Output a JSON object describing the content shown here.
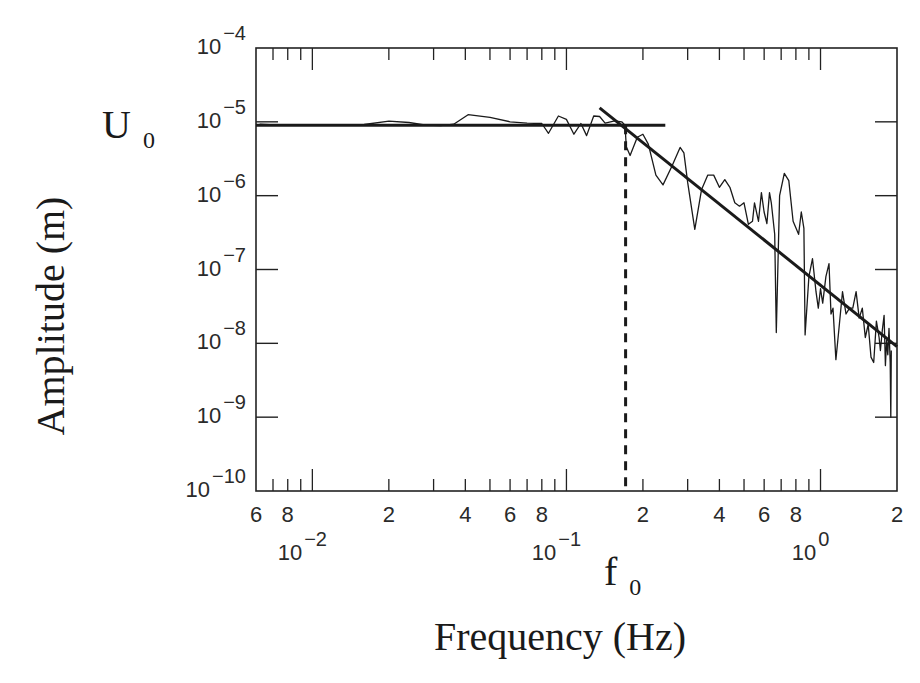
{
  "chart_data": {
    "type": "line",
    "title": "",
    "xlabel": "Frequency (Hz)",
    "ylabel": "Amplitude (m)",
    "xscale": "log",
    "yscale": "log",
    "xlim": [
      0.006,
      2
    ],
    "ylim": [
      1e-10,
      0.0001
    ],
    "grid": false,
    "legend": null,
    "annotations": [
      {
        "text": "U",
        "sub": "0",
        "role": "plateau amplitude marker at ~1e-5 m on y-axis"
      },
      {
        "text": "f",
        "sub": "0",
        "role": "corner frequency marker on x-axis at ~0.17 Hz"
      }
    ],
    "y_ticks": [
      {
        "base": "10",
        "exp": "-4",
        "value": 0.0001
      },
      {
        "base": "10",
        "exp": "-5",
        "value": 1e-05
      },
      {
        "base": "10",
        "exp": "-6",
        "value": 1e-06
      },
      {
        "base": "10",
        "exp": "-7",
        "value": 1e-07
      },
      {
        "base": "10",
        "exp": "-8",
        "value": 1e-08
      },
      {
        "base": "10",
        "exp": "-9",
        "value": 1e-09
      },
      {
        "base": "10",
        "exp": "-10",
        "value": 1e-10
      }
    ],
    "x_minor_labels": [
      {
        "text": "6",
        "value": 0.006
      },
      {
        "text": "8",
        "value": 0.008
      },
      {
        "text": "2",
        "value": 0.02
      },
      {
        "text": "4",
        "value": 0.04
      },
      {
        "text": "6",
        "value": 0.06
      },
      {
        "text": "8",
        "value": 0.08
      },
      {
        "text": "2",
        "value": 0.2
      },
      {
        "text": "4",
        "value": 0.4
      },
      {
        "text": "6",
        "value": 0.6
      },
      {
        "text": "8",
        "value": 0.8
      },
      {
        "text": "2",
        "value": 2
      }
    ],
    "x_decade_labels": [
      {
        "base": "10",
        "exp": "-2",
        "value": 0.01
      },
      {
        "base": "10",
        "exp": "-1",
        "value": 0.1
      },
      {
        "base": "10",
        "exp": "0",
        "value": 1
      }
    ],
    "series": [
      {
        "name": "Observed displacement spectrum",
        "style": "thin solid",
        "points": [
          [
            0.0062,
            9.3e-06
          ],
          [
            0.0075,
            9e-06
          ],
          [
            0.0095,
            9e-06
          ],
          [
            0.012,
            9e-06
          ],
          [
            0.016,
            9.2e-06
          ],
          [
            0.02,
            1.02e-05
          ],
          [
            0.024,
            9.8e-06
          ],
          [
            0.028,
            9e-06
          ],
          [
            0.032,
            8.9e-06
          ],
          [
            0.036,
            9.3e-06
          ],
          [
            0.041,
            1.25e-05
          ],
          [
            0.05,
            1.15e-05
          ],
          [
            0.06,
            1e-05
          ],
          [
            0.07,
            9.6e-06
          ],
          [
            0.08,
            9.5e-06
          ],
          [
            0.085,
            7e-06
          ],
          [
            0.093,
            1.2e-05
          ],
          [
            0.1,
            1.08e-05
          ],
          [
            0.107,
            6.8e-06
          ],
          [
            0.114,
            9.5e-06
          ],
          [
            0.12,
            6.5e-06
          ],
          [
            0.128,
            1.2e-05
          ],
          [
            0.135,
            1.18e-05
          ],
          [
            0.142,
            9.6e-06
          ],
          [
            0.155,
            1.03e-05
          ],
          [
            0.165,
            1e-05
          ],
          [
            0.17,
            9e-06
          ],
          [
            0.172,
            4.6e-06
          ],
          [
            0.178,
            3.5e-06
          ],
          [
            0.19,
            6.2e-06
          ],
          [
            0.2,
            6.8e-06
          ],
          [
            0.21,
            5e-06
          ],
          [
            0.225,
            1.9e-06
          ],
          [
            0.24,
            1.4e-06
          ],
          [
            0.26,
            2.5e-06
          ],
          [
            0.28,
            4.5e-06
          ],
          [
            0.29,
            3.8e-06
          ],
          [
            0.3,
            1.5e-06
          ],
          [
            0.32,
            3.5e-07
          ],
          [
            0.34,
            1.2e-06
          ],
          [
            0.36,
            1.9e-06
          ],
          [
            0.38,
            1.9e-06
          ],
          [
            0.4,
            1.3e-06
          ],
          [
            0.42,
            1.65e-06
          ],
          [
            0.44,
            1.3e-06
          ],
          [
            0.46,
            8e-07
          ],
          [
            0.48,
            7.2e-07
          ],
          [
            0.5,
            8e-07
          ],
          [
            0.52,
            4.1e-07
          ],
          [
            0.54,
            4.5e-07
          ],
          [
            0.55,
            8e-07
          ],
          [
            0.57,
            4.5e-07
          ],
          [
            0.585,
            1.1e-06
          ],
          [
            0.6,
            6e-07
          ],
          [
            0.615,
            4.2e-07
          ],
          [
            0.63,
            1.1e-06
          ],
          [
            0.64,
            8e-07
          ],
          [
            0.66,
            3e-07
          ],
          [
            0.67,
            1.4e-08
          ],
          [
            0.69,
            1e-06
          ],
          [
            0.72,
            2e-06
          ],
          [
            0.75,
            1.6e-06
          ],
          [
            0.78,
            4.5e-07
          ],
          [
            0.82,
            3e-07
          ],
          [
            0.84,
            6e-07
          ],
          [
            0.86,
            3.6e-07
          ],
          [
            0.87,
            1.3e-08
          ],
          [
            0.9,
            8e-08
          ],
          [
            0.93,
            1.4e-07
          ],
          [
            0.96,
            5e-08
          ],
          [
            0.98,
            3e-08
          ],
          [
            1.0,
            5.5e-08
          ],
          [
            1.02,
            3.5e-08
          ],
          [
            1.05,
            8e-08
          ],
          [
            1.08,
            1.2e-07
          ],
          [
            1.1,
            2.5e-08
          ],
          [
            1.12,
            3e-08
          ],
          [
            1.15,
            6e-09
          ],
          [
            1.18,
            1.5e-08
          ],
          [
            1.22,
            5e-08
          ],
          [
            1.26,
            2.5e-08
          ],
          [
            1.3,
            3e-08
          ],
          [
            1.34,
            3e-08
          ],
          [
            1.38,
            5e-08
          ],
          [
            1.42,
            2.2e-08
          ],
          [
            1.46,
            3e-08
          ],
          [
            1.5,
            1.2e-08
          ],
          [
            1.54,
            1.8e-08
          ],
          [
            1.58,
            6.5e-09
          ],
          [
            1.62,
            5.5e-09
          ],
          [
            1.66,
            2e-08
          ],
          [
            1.7,
            1.2e-08
          ],
          [
            1.72,
            8e-09
          ],
          [
            1.75,
            1.5e-08
          ],
          [
            1.78,
            2.4e-08
          ],
          [
            1.8,
            5e-09
          ],
          [
            1.82,
            1.1e-08
          ],
          [
            1.84,
            7e-09
          ],
          [
            1.86,
            1.6e-08
          ],
          [
            1.88,
            5.5e-09
          ],
          [
            1.89,
            1e-09
          ],
          [
            1.9,
            8e-09
          ]
        ]
      },
      {
        "name": "Plateau fit (U0)",
        "style": "thick solid",
        "points": [
          [
            0.006,
            9e-06
          ],
          [
            0.245,
            9e-06
          ]
        ]
      },
      {
        "name": "High-frequency decay fit",
        "style": "thick solid",
        "points": [
          [
            0.135,
            1.55e-05
          ],
          [
            2.0,
            9e-09
          ]
        ]
      },
      {
        "name": "Corner frequency f0",
        "style": "thick dashed vertical",
        "points": [
          [
            0.171,
            9e-06
          ],
          [
            0.171,
            1e-10
          ]
        ]
      }
    ]
  },
  "labels": {
    "y_axis_title": "Amplitude (m)",
    "x_axis_title": "Frequency (Hz)",
    "u0_main": "U",
    "u0_sub": "0",
    "f0_main": "f",
    "f0_sub": "0"
  }
}
